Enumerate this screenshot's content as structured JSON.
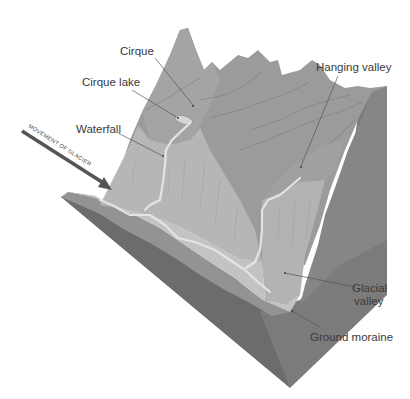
{
  "diagram": {
    "labels": {
      "cirque": "Cirque",
      "cirque_lake": "Cirque lake",
      "waterfall": "Waterfall",
      "hanging_valley": "Hanging valley",
      "glacial_valley_line1": "Glacial",
      "glacial_valley_line2": "valley",
      "ground_moraine": "Ground moraine"
    },
    "arrow": {
      "text": "MOVEMENT OF GLACIER"
    },
    "colors": {
      "background": "#ffffff",
      "mountain": "#9a9a9a",
      "mountain_light": "#a8a8a8",
      "valley_wall": "#b9b9b9",
      "valley_floor": "#c2c2c2",
      "block_front": "#6e6e6e",
      "block_right": "#7c7c7c",
      "moraine_layer": "#959595",
      "stream": "#e4e4e4",
      "arrow": "#555555",
      "label_text": "#3a3a3a"
    }
  }
}
